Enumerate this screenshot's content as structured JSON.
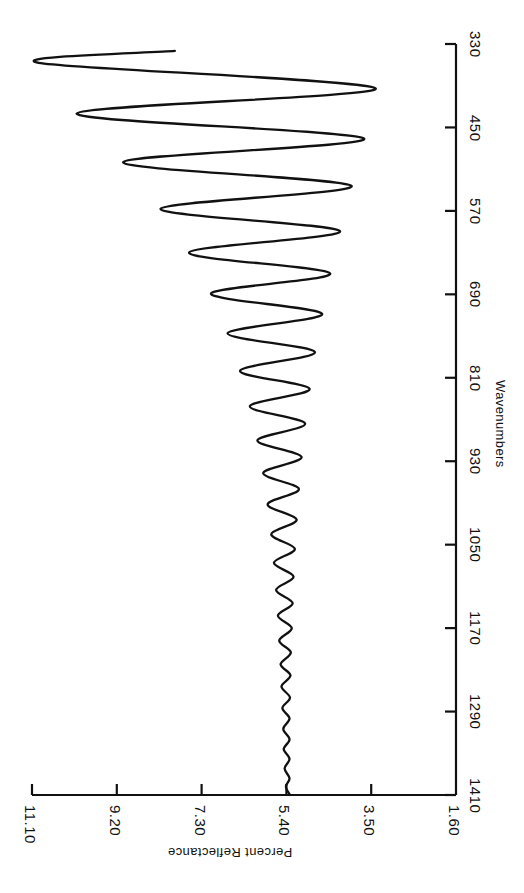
{
  "chart_data": {
    "type": "line",
    "title": "",
    "subtitle": "",
    "orientation": "rotated-90",
    "xlabel": "Percent Reflectance",
    "ylabel": "Wavenumbers",
    "xlabel_rotation_deg": 180,
    "ylabel_rotation_deg": 90,
    "grid": false,
    "legend": null,
    "legend_position": "none",
    "line_color": "#111111",
    "background_color": "#ffffff",
    "axis_color": "#111111",
    "xlim": [
      1.6,
      11.1
    ],
    "ylim": [
      330,
      1410
    ],
    "xticks": [
      11.1,
      9.2,
      7.3,
      5.4,
      3.5,
      1.6
    ],
    "xtick_labels": [
      "11.10",
      "9.20",
      "7.30",
      "5.40",
      "3.50",
      "1.60"
    ],
    "yticks": [
      330,
      450,
      570,
      690,
      810,
      930,
      1050,
      1170,
      1290,
      1410
    ],
    "ytick_labels": [
      "330",
      "450",
      "570",
      "690",
      "810",
      "930",
      "1050",
      "1170",
      "1290",
      "1410"
    ],
    "series": [
      {
        "name": "reflectance",
        "x_axis": "wavenumbers",
        "y_axis": "percent_reflectance",
        "baseline_percent": 5.45,
        "points": [
          {
            "wavenumbers": 1410,
            "percent_reflectance": 5.32
          },
          {
            "wavenumbers": 1398,
            "percent_reflectance": 5.41
          },
          {
            "wavenumbers": 1386,
            "percent_reflectance": 5.33
          },
          {
            "wavenumbers": 1372,
            "percent_reflectance": 5.44
          },
          {
            "wavenumbers": 1358,
            "percent_reflectance": 5.33
          },
          {
            "wavenumbers": 1344,
            "percent_reflectance": 5.46
          },
          {
            "wavenumbers": 1330,
            "percent_reflectance": 5.33
          },
          {
            "wavenumbers": 1315,
            "percent_reflectance": 5.47
          },
          {
            "wavenumbers": 1300,
            "percent_reflectance": 5.33
          },
          {
            "wavenumbers": 1285,
            "percent_reflectance": 5.49
          },
          {
            "wavenumbers": 1270,
            "percent_reflectance": 5.32
          },
          {
            "wavenumbers": 1254,
            "percent_reflectance": 5.51
          },
          {
            "wavenumbers": 1238,
            "percent_reflectance": 5.31
          },
          {
            "wavenumbers": 1222,
            "percent_reflectance": 5.53
          },
          {
            "wavenumbers": 1205,
            "percent_reflectance": 5.3
          },
          {
            "wavenumbers": 1188,
            "percent_reflectance": 5.56
          },
          {
            "wavenumbers": 1170,
            "percent_reflectance": 5.28
          },
          {
            "wavenumbers": 1152,
            "percent_reflectance": 5.59
          },
          {
            "wavenumbers": 1134,
            "percent_reflectance": 5.26
          },
          {
            "wavenumbers": 1115,
            "percent_reflectance": 5.63
          },
          {
            "wavenumbers": 1096,
            "percent_reflectance": 5.24
          },
          {
            "wavenumbers": 1076,
            "percent_reflectance": 5.68
          },
          {
            "wavenumbers": 1056,
            "percent_reflectance": 5.21
          },
          {
            "wavenumbers": 1035,
            "percent_reflectance": 5.74
          },
          {
            "wavenumbers": 1014,
            "percent_reflectance": 5.17
          },
          {
            "wavenumbers": 992,
            "percent_reflectance": 5.82
          },
          {
            "wavenumbers": 970,
            "percent_reflectance": 5.12
          },
          {
            "wavenumbers": 947,
            "percent_reflectance": 5.92
          },
          {
            "wavenumbers": 924,
            "percent_reflectance": 5.06
          },
          {
            "wavenumbers": 900,
            "percent_reflectance": 6.05
          },
          {
            "wavenumbers": 876,
            "percent_reflectance": 4.98
          },
          {
            "wavenumbers": 851,
            "percent_reflectance": 6.22
          },
          {
            "wavenumbers": 826,
            "percent_reflectance": 4.88
          },
          {
            "wavenumbers": 800,
            "percent_reflectance": 6.44
          },
          {
            "wavenumbers": 773,
            "percent_reflectance": 4.76
          },
          {
            "wavenumbers": 746,
            "percent_reflectance": 6.72
          },
          {
            "wavenumbers": 718,
            "percent_reflectance": 4.6
          },
          {
            "wavenumbers": 689,
            "percent_reflectance": 7.09
          },
          {
            "wavenumbers": 660,
            "percent_reflectance": 4.42
          },
          {
            "wavenumbers": 630,
            "percent_reflectance": 7.58
          },
          {
            "wavenumbers": 599,
            "percent_reflectance": 4.2
          },
          {
            "wavenumbers": 567,
            "percent_reflectance": 8.22
          },
          {
            "wavenumbers": 534,
            "percent_reflectance": 3.94
          },
          {
            "wavenumbers": 500,
            "percent_reflectance": 9.06
          },
          {
            "wavenumbers": 466,
            "percent_reflectance": 3.66
          },
          {
            "wavenumbers": 430,
            "percent_reflectance": 10.1
          },
          {
            "wavenumbers": 394,
            "percent_reflectance": 3.4
          },
          {
            "wavenumbers": 357,
            "percent_reflectance": 10.95
          },
          {
            "wavenumbers": 340,
            "percent_reflectance": 7.9
          }
        ]
      }
    ]
  },
  "axes": {
    "wavenumbers": {
      "title": "Wavenumbers",
      "ticks": [
        {
          "value": 330,
          "label": "330"
        },
        {
          "value": 450,
          "label": "450"
        },
        {
          "value": 570,
          "label": "570"
        },
        {
          "value": 690,
          "label": "690"
        },
        {
          "value": 810,
          "label": "810"
        },
        {
          "value": 930,
          "label": "930"
        },
        {
          "value": 1050,
          "label": "1050"
        },
        {
          "value": 1170,
          "label": "1170"
        },
        {
          "value": 1290,
          "label": "1290"
        },
        {
          "value": 1410,
          "label": "1410"
        }
      ]
    },
    "percent_reflectance": {
      "title": "Percent Reflectance",
      "ticks": [
        {
          "value": 11.1,
          "label": "11.10"
        },
        {
          "value": 9.2,
          "label": "9.20"
        },
        {
          "value": 7.3,
          "label": "7.30"
        },
        {
          "value": 5.4,
          "label": "5.40"
        },
        {
          "value": 3.5,
          "label": "3.50"
        },
        {
          "value": 1.6,
          "label": "1.60"
        }
      ]
    }
  }
}
